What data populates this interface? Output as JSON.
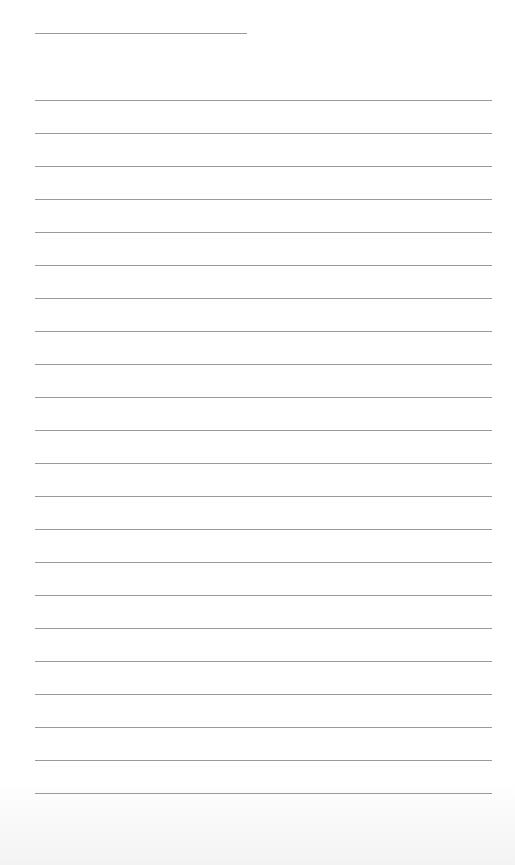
{
  "page": {
    "type": "lined-paper",
    "background_color": "#ffffff",
    "line_color": "#9a9a9a"
  },
  "title_line": {
    "x": 35,
    "y": 33,
    "width": 212,
    "text": ""
  },
  "ruled_lines": {
    "count": 22,
    "start_y": 100,
    "spacing": 33,
    "x": 35,
    "width": 457,
    "entries": [
      "",
      "",
      "",
      "",
      "",
      "",
      "",
      "",
      "",
      "",
      "",
      "",
      "",
      "",
      "",
      "",
      "",
      "",
      "",
      "",
      "",
      ""
    ]
  }
}
